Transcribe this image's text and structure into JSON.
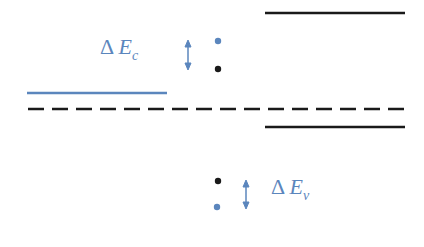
{
  "diagram": {
    "type": "band-alignment",
    "colors": {
      "blue": "#5b86bd",
      "black": "#1a1a1a",
      "background": "#ffffff"
    },
    "labels": {
      "delta_ec": {
        "symbol": "Δ",
        "variable": "E",
        "subscript": "c"
      },
      "delta_ev": {
        "symbol": "Δ",
        "variable": "E",
        "subscript": "v"
      }
    },
    "lines": [
      {
        "id": "right-conduction-band",
        "color": "black",
        "style": "solid",
        "x1": 265,
        "x2": 405,
        "y": 13
      },
      {
        "id": "left-conduction-band",
        "color": "blue",
        "style": "solid",
        "x1": 27,
        "x2": 167,
        "y": 93
      },
      {
        "id": "fermi-level",
        "color": "black",
        "style": "dashed",
        "x1": 28,
        "x2": 405,
        "y": 109
      },
      {
        "id": "right-valence-band",
        "color": "black",
        "style": "solid",
        "x1": 265,
        "x2": 405,
        "y": 127
      }
    ],
    "dots": [
      {
        "color": "blue",
        "x": 218,
        "y": 41
      },
      {
        "color": "black",
        "x": 218,
        "y": 69
      },
      {
        "color": "black",
        "x": 218,
        "y": 181
      },
      {
        "color": "blue",
        "x": 217,
        "y": 207
      }
    ],
    "arrows": [
      {
        "id": "delta-ec-arrow",
        "x": 188,
        "y1": 41,
        "y2": 69
      },
      {
        "id": "delta-ev-arrow",
        "x": 246,
        "y1": 181,
        "y2": 207
      }
    ]
  }
}
